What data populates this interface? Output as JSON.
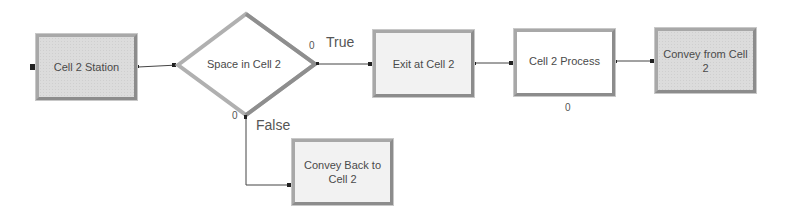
{
  "diagram": {
    "modules": [
      {
        "id": "cell2_station",
        "label": "Cell 2 Station",
        "type": "station"
      },
      {
        "id": "space_in_cell2",
        "label": "Space in Cell 2",
        "type": "decide"
      },
      {
        "id": "exit_at_cell2",
        "label": "Exit at Cell 2",
        "type": "exit"
      },
      {
        "id": "cell2_process",
        "label": "Cell 2 Process",
        "type": "process"
      },
      {
        "id": "convey_from_cell2",
        "label": "Convey from Cell 2",
        "type": "convey"
      },
      {
        "id": "convey_back_to_cell2",
        "label": "Convey Back to Cell 2",
        "type": "convey"
      }
    ],
    "branches": {
      "true_label": "True",
      "false_label": "False",
      "true_count": "0",
      "false_count": "0"
    },
    "process_count": "0",
    "connections": [
      {
        "from": "cell2_station",
        "to": "space_in_cell2"
      },
      {
        "from": "space_in_cell2",
        "to": "exit_at_cell2",
        "branch": "True"
      },
      {
        "from": "space_in_cell2",
        "to": "convey_back_to_cell2",
        "branch": "False"
      },
      {
        "from": "exit_at_cell2",
        "to": "cell2_process"
      },
      {
        "from": "cell2_process",
        "to": "convey_from_cell2"
      }
    ],
    "colors": {
      "module_border": "#a8a8a8",
      "module_fill": "#dcdcdc",
      "connector": "#333333",
      "text": "#4a4a4a"
    }
  }
}
